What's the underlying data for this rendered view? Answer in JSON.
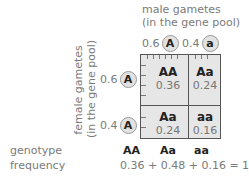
{
  "male": {
    "title": "male gametes",
    "subtitle": "(in the gene pool)",
    "gametes": [
      {
        "freq": "0.6",
        "allele": "A"
      },
      {
        "freq": "0.4",
        "allele": "a"
      }
    ]
  },
  "female": {
    "title": "female gametes",
    "subtitle": "(in the gene pool)",
    "gametes": [
      {
        "freq": "0.6",
        "allele": "A"
      },
      {
        "freq": "0.4",
        "allele": "A"
      }
    ]
  },
  "grid": {
    "cells": [
      {
        "genotype": "AA",
        "freq": "0.36"
      },
      {
        "genotype": "Aa",
        "freq": "0.24"
      },
      {
        "genotype": "Aa",
        "freq": "0.24"
      },
      {
        "genotype": "aa",
        "freq": "0.16"
      }
    ]
  },
  "summary": {
    "genotype_label": "genotype",
    "frequency_label": "frequency",
    "genotypes": [
      "AA",
      "Aa",
      "aa"
    ],
    "equation": "0.36 + 0.48 + 0.16 = 1.0"
  }
}
